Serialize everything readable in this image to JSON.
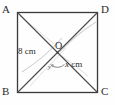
{
  "figure": {
    "shape": "square",
    "vertices": [
      {
        "name": "A",
        "label": "A",
        "position": "top-left"
      },
      {
        "name": "D",
        "label": "D",
        "position": "top-right"
      },
      {
        "name": "B",
        "label": "B",
        "position": "bottom-left"
      },
      {
        "name": "C",
        "label": "C",
        "position": "bottom-right"
      }
    ],
    "center": {
      "name": "O",
      "label": "O"
    },
    "segments": [
      {
        "name": "segment-OB",
        "label": "8 cm",
        "value": "8",
        "unit": "cm"
      },
      {
        "name": "segment-OC",
        "label_var": "x",
        "label_unit": "cm"
      }
    ],
    "angle": {
      "name": "angle-at-O",
      "label": "y°",
      "variable": "y"
    },
    "colors": {
      "outline": "#3a3a3a",
      "diagonal": "#4a4a4a",
      "arc": "#cfcfcf",
      "text": "#2a2a2a",
      "background": "#fefefe"
    }
  }
}
